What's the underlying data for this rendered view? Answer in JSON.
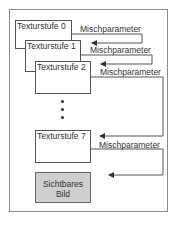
{
  "diagram": {
    "stages": [
      {
        "label": "Texturstufe 0"
      },
      {
        "label": "Texturstufe 1"
      },
      {
        "label": "Texturstufe 2"
      },
      {
        "label": "Texturstufe 7"
      }
    ],
    "blend_labels": [
      "Mischparameter",
      "Mischparameter",
      "Mischparameter",
      "Mischparameter"
    ],
    "ellipsis": "⋮",
    "output": {
      "line1": "Sichtbares",
      "line2": "Bild"
    },
    "colors": {
      "line": "#555555",
      "frame": "#8a8a8a",
      "output_fill": "#cfcfcf"
    }
  }
}
